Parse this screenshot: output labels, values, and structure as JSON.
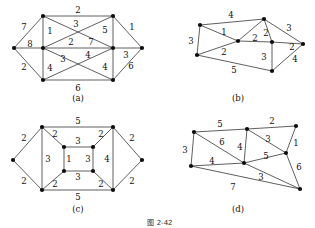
{
  "figure": {
    "caption": "图 2-42",
    "panels": [
      {
        "id": "a",
        "caption": "(a)",
        "caption_pos": [
          78,
          101
        ],
        "nodes": [
          {
            "name": "node-a-left",
            "x": 14,
            "y": 48
          },
          {
            "name": "node-a-top-left",
            "x": 43,
            "y": 16
          },
          {
            "name": "node-a-top-right",
            "x": 113,
            "y": 16
          },
          {
            "name": "node-a-right",
            "x": 142,
            "y": 48
          },
          {
            "name": "node-a-mid-left",
            "x": 43,
            "y": 48
          },
          {
            "name": "node-a-mid-right",
            "x": 113,
            "y": 48
          },
          {
            "name": "node-a-bottom-left",
            "x": 43,
            "y": 80
          },
          {
            "name": "node-a-bottom-right",
            "x": 113,
            "y": 80
          }
        ],
        "edges": [
          {
            "from": 0,
            "to": 1
          },
          {
            "from": 0,
            "to": 4
          },
          {
            "from": 0,
            "to": 6
          },
          {
            "from": 1,
            "to": 2
          },
          {
            "from": 1,
            "to": 4
          },
          {
            "from": 1,
            "to": 5
          },
          {
            "from": 2,
            "to": 3
          },
          {
            "from": 2,
            "to": 4
          },
          {
            "from": 2,
            "to": 5
          },
          {
            "from": 3,
            "to": 5
          },
          {
            "from": 3,
            "to": 7
          },
          {
            "from": 4,
            "to": 5
          },
          {
            "from": 4,
            "to": 6
          },
          {
            "from": 4,
            "to": 7
          },
          {
            "from": 5,
            "to": 6
          },
          {
            "from": 5,
            "to": 7
          },
          {
            "from": 6,
            "to": 7
          }
        ],
        "weights": [
          {
            "value": "2",
            "x": 78,
            "y": 10
          },
          {
            "value": "7",
            "x": 24,
            "y": 27
          },
          {
            "value": "1",
            "x": 50,
            "y": 31
          },
          {
            "value": "3",
            "x": 76,
            "y": 24
          },
          {
            "value": "5",
            "x": 105,
            "y": 30
          },
          {
            "value": "1",
            "x": 132,
            "y": 27
          },
          {
            "value": "8",
            "x": 30,
            "y": 44
          },
          {
            "value": "2",
            "x": 71,
            "y": 42
          },
          {
            "value": "7",
            "x": 91,
            "y": 42
          },
          {
            "value": "2",
            "x": 24,
            "y": 67
          },
          {
            "value": "3",
            "x": 126,
            "y": 55
          },
          {
            "value": "3",
            "x": 63,
            "y": 59
          },
          {
            "value": "4",
            "x": 88,
            "y": 55
          },
          {
            "value": "4",
            "x": 50,
            "y": 68
          },
          {
            "value": "4",
            "x": 105,
            "y": 67
          },
          {
            "value": "6",
            "x": 131,
            "y": 66
          },
          {
            "value": "6",
            "x": 78,
            "y": 88
          }
        ]
      },
      {
        "id": "b",
        "caption": "(b)",
        "caption_pos": [
          238,
          101
        ],
        "nodes": [
          {
            "name": "node-b-left-top",
            "x": 200,
            "y": 25
          },
          {
            "name": "node-b-top",
            "x": 264,
            "y": 19
          },
          {
            "name": "node-b-left-bottom",
            "x": 197,
            "y": 55
          },
          {
            "name": "node-b-center",
            "x": 238,
            "y": 41
          },
          {
            "name": "node-b-mid-right",
            "x": 272,
            "y": 42
          },
          {
            "name": "node-b-right",
            "x": 303,
            "y": 44
          },
          {
            "name": "node-b-bottom",
            "x": 272,
            "y": 71
          }
        ],
        "edges": [
          {
            "from": 0,
            "to": 1
          },
          {
            "from": 0,
            "to": 2
          },
          {
            "from": 0,
            "to": 3
          },
          {
            "from": 1,
            "to": 4
          },
          {
            "from": 1,
            "to": 5
          },
          {
            "from": 1,
            "to": 3
          },
          {
            "from": 2,
            "to": 3
          },
          {
            "from": 2,
            "to": 6
          },
          {
            "from": 3,
            "to": 4
          },
          {
            "from": 4,
            "to": 5
          },
          {
            "from": 4,
            "to": 6
          },
          {
            "from": 5,
            "to": 6
          }
        ],
        "weights": [
          {
            "value": "4",
            "x": 231,
            "y": 15
          },
          {
            "value": "3",
            "x": 191,
            "y": 41
          },
          {
            "value": "1",
            "x": 224,
            "y": 32
          },
          {
            "value": "2",
            "x": 255,
            "y": 38
          },
          {
            "value": "2",
            "x": 266,
            "y": 33
          },
          {
            "value": "3",
            "x": 289,
            "y": 28
          },
          {
            "value": "2",
            "x": 292,
            "y": 47
          },
          {
            "value": "2",
            "x": 224,
            "y": 52
          },
          {
            "value": "3",
            "x": 264,
            "y": 57
          },
          {
            "value": "4",
            "x": 295,
            "y": 59
          },
          {
            "value": "5",
            "x": 234,
            "y": 70
          }
        ]
      },
      {
        "id": "c",
        "caption": "(c)",
        "caption_pos": [
          78,
          212
        ],
        "nodes": [
          {
            "name": "node-c-left",
            "x": 13,
            "y": 160
          },
          {
            "name": "node-c-top-left",
            "x": 42,
            "y": 127
          },
          {
            "name": "node-c-top-right",
            "x": 113,
            "y": 127
          },
          {
            "name": "node-c-right",
            "x": 142,
            "y": 160
          },
          {
            "name": "node-c-bottom-left",
            "x": 42,
            "y": 190
          },
          {
            "name": "node-c-bottom-right",
            "x": 113,
            "y": 190
          },
          {
            "name": "node-c-inner-top-left",
            "x": 64,
            "y": 147
          },
          {
            "name": "node-c-inner-top-right",
            "x": 93,
            "y": 147
          },
          {
            "name": "node-c-inner-bot-left",
            "x": 64,
            "y": 171
          },
          {
            "name": "node-c-inner-bot-right",
            "x": 93,
            "y": 171
          }
        ],
        "edges": [
          {
            "from": 0,
            "to": 1
          },
          {
            "from": 0,
            "to": 4
          },
          {
            "from": 1,
            "to": 2
          },
          {
            "from": 1,
            "to": 4
          },
          {
            "from": 1,
            "to": 6
          },
          {
            "from": 2,
            "to": 3
          },
          {
            "from": 2,
            "to": 5
          },
          {
            "from": 2,
            "to": 7
          },
          {
            "from": 3,
            "to": 5
          },
          {
            "from": 4,
            "to": 5
          },
          {
            "from": 4,
            "to": 8
          },
          {
            "from": 5,
            "to": 9
          },
          {
            "from": 6,
            "to": 7
          },
          {
            "from": 6,
            "to": 8
          },
          {
            "from": 7,
            "to": 9
          },
          {
            "from": 8,
            "to": 9
          }
        ],
        "weights": [
          {
            "value": "5",
            "x": 78,
            "y": 121
          },
          {
            "value": "2",
            "x": 24,
            "y": 138
          },
          {
            "value": "2",
            "x": 55,
            "y": 134
          },
          {
            "value": "2",
            "x": 101,
            "y": 134
          },
          {
            "value": "2",
            "x": 132,
            "y": 138
          },
          {
            "value": "3",
            "x": 78,
            "y": 141
          },
          {
            "value": "3",
            "x": 48,
            "y": 159
          },
          {
            "value": "1",
            "x": 69,
            "y": 159
          },
          {
            "value": "3",
            "x": 88,
            "y": 159
          },
          {
            "value": "4",
            "x": 107,
            "y": 159
          },
          {
            "value": "3",
            "x": 78,
            "y": 177
          },
          {
            "value": "2",
            "x": 24,
            "y": 181
          },
          {
            "value": "2",
            "x": 55,
            "y": 184
          },
          {
            "value": "2",
            "x": 101,
            "y": 184
          },
          {
            "value": "2",
            "x": 132,
            "y": 181
          },
          {
            "value": "5",
            "x": 78,
            "y": 197
          }
        ]
      },
      {
        "id": "d",
        "caption": "(d)",
        "caption_pos": [
          238,
          212
        ],
        "nodes": [
          {
            "name": "node-d-top-left",
            "x": 194,
            "y": 132
          },
          {
            "name": "node-d-top-mid",
            "x": 247,
            "y": 129
          },
          {
            "name": "node-d-top-right",
            "x": 296,
            "y": 126
          },
          {
            "name": "node-d-left",
            "x": 191,
            "y": 166
          },
          {
            "name": "node-d-center",
            "x": 244,
            "y": 163
          },
          {
            "name": "node-d-mid-right",
            "x": 286,
            "y": 153
          },
          {
            "name": "node-d-bottom-right",
            "x": 300,
            "y": 189
          }
        ],
        "edges": [
          {
            "from": 0,
            "to": 1
          },
          {
            "from": 0,
            "to": 3
          },
          {
            "from": 0,
            "to": 4
          },
          {
            "from": 1,
            "to": 2
          },
          {
            "from": 1,
            "to": 4
          },
          {
            "from": 1,
            "to": 5
          },
          {
            "from": 2,
            "to": 5
          },
          {
            "from": 3,
            "to": 4
          },
          {
            "from": 3,
            "to": 6
          },
          {
            "from": 4,
            "to": 5
          },
          {
            "from": 4,
            "to": 6
          },
          {
            "from": 5,
            "to": 6
          }
        ],
        "weights": [
          {
            "value": "5",
            "x": 220,
            "y": 124
          },
          {
            "value": "2",
            "x": 272,
            "y": 121
          },
          {
            "value": "3",
            "x": 185,
            "y": 150
          },
          {
            "value": "6",
            "x": 222,
            "y": 142
          },
          {
            "value": "4",
            "x": 240,
            "y": 147
          },
          {
            "value": "3",
            "x": 268,
            "y": 139
          },
          {
            "value": "1",
            "x": 296,
            "y": 143
          },
          {
            "value": "4",
            "x": 212,
            "y": 161
          },
          {
            "value": "5",
            "x": 266,
            "y": 156
          },
          {
            "value": "6",
            "x": 299,
            "y": 167
          },
          {
            "value": "3",
            "x": 261,
            "y": 177
          },
          {
            "value": "7",
            "x": 233,
            "y": 187
          }
        ]
      }
    ]
  }
}
